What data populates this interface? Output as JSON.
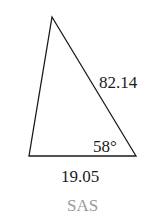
{
  "diagram": {
    "type": "triangle",
    "side_labels": {
      "right_side": "82.14",
      "base": "19.05"
    },
    "angle_label": "58°",
    "caption": "SAS",
    "colors": {
      "stroke": "#1a1a1a",
      "caption": "#9a9a9a"
    }
  }
}
